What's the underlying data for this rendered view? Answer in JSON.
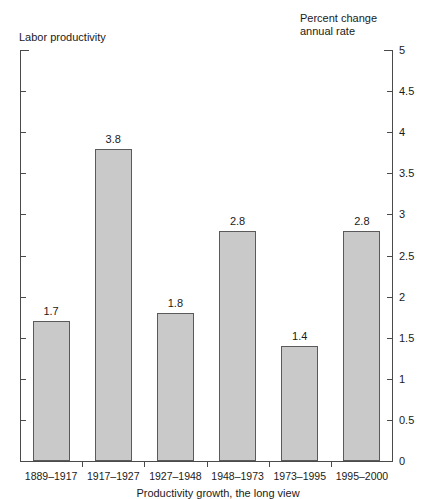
{
  "chart_data": {
    "type": "bar",
    "title": "",
    "left_axis_title": "Labor productivity",
    "right_axis_title": "Percent change\nannual rate",
    "xlabel": "",
    "ylabel": "Percent change annual rate",
    "categories": [
      "1889–1917",
      "1917–1927",
      "1927–1948",
      "1948–1973",
      "1973–1995",
      "1995–2000"
    ],
    "values": [
      1.7,
      3.8,
      1.8,
      2.8,
      1.4,
      2.8
    ],
    "value_labels": [
      "1.7",
      "3.8",
      "1.8",
      "2.8",
      "1.4",
      "2.8"
    ],
    "ylim": [
      0,
      5
    ],
    "ytick_values": [
      0,
      0.5,
      1,
      1.5,
      2,
      2.5,
      3,
      3.5,
      4,
      4.5,
      5
    ],
    "ytick_labels": [
      "0",
      "0.5",
      "1",
      "1.5",
      "2",
      "2.5",
      "3",
      "3.5",
      "4",
      "4.5",
      "5"
    ],
    "ytick_side": "right",
    "grid": false,
    "legend": null,
    "bar_color": "#c9c9c9",
    "bar_border_color": "#5a5a5a",
    "axis_color": "#4a4a4a"
  },
  "caption": "Productivity growth, the long view"
}
